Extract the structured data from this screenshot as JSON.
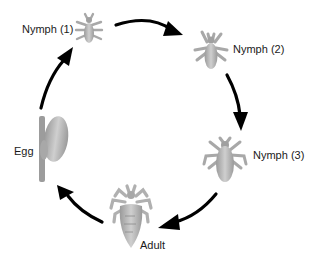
{
  "diagram": {
    "stages": [
      {
        "id": "nymph1",
        "label": "Nymph (1)"
      },
      {
        "id": "nymph2",
        "label": "Nymph (2)"
      },
      {
        "id": "nymph3",
        "label": "Nymph (3)"
      },
      {
        "id": "adult",
        "label": "Adult"
      },
      {
        "id": "egg",
        "label": "Egg"
      }
    ],
    "flow": [
      "Nymph (1)",
      "Nymph (2)",
      "Nymph (3)",
      "Adult",
      "Egg",
      "Nymph (1)"
    ],
    "colors": {
      "arrow": "#000000",
      "insect_fill": "#b8b8b8",
      "insect_dark": "#8f8f8f",
      "text": "#1a1a1a",
      "background": "#ffffff"
    }
  }
}
